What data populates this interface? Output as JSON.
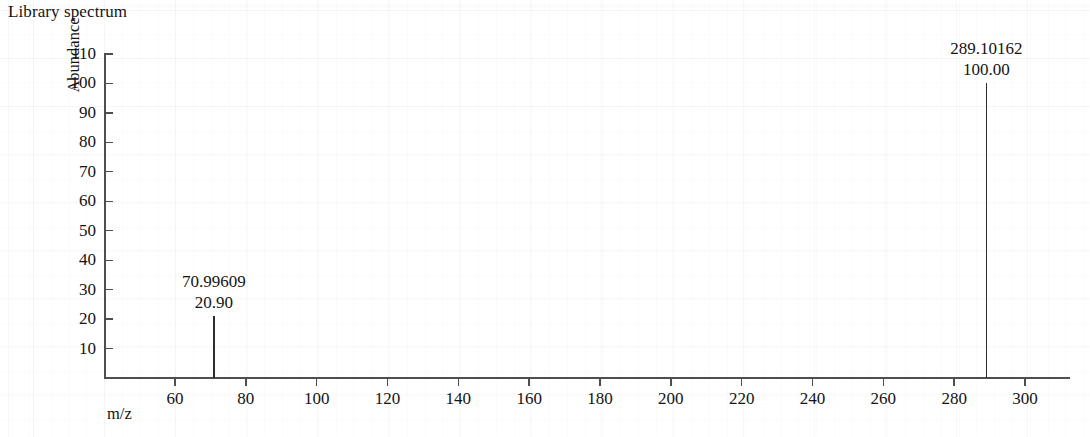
{
  "chart": {
    "title": "Library spectrum",
    "xlabel": "m/z",
    "ylabel": "Abundance"
  },
  "axes": {
    "y_ticks": [
      "110",
      "100",
      "90",
      "80",
      "70",
      "60",
      "50",
      "40",
      "30",
      "20",
      "10"
    ],
    "x_ticks": [
      "60",
      "80",
      "100",
      "120",
      "140",
      "160",
      "180",
      "200",
      "220",
      "240",
      "260",
      "280",
      "300"
    ]
  },
  "peaks": [
    {
      "mz": "70.99609",
      "abundance": "20.90"
    },
    {
      "mz": "289.10162",
      "abundance": "100.00"
    }
  ],
  "chart_data": {
    "type": "bar",
    "title": "Library spectrum",
    "subtitle": "",
    "xlabel": "m/z",
    "ylabel": "Abundance",
    "xlim": [
      45,
      313
    ],
    "ylim": [
      0,
      110
    ],
    "yticks": [
      10,
      20,
      30,
      40,
      50,
      60,
      70,
      80,
      90,
      100,
      110
    ],
    "xticks": [
      60,
      80,
      100,
      120,
      140,
      160,
      180,
      200,
      220,
      240,
      260,
      280,
      300
    ],
    "grid": false,
    "legend": null,
    "x": [
      70.99609,
      289.10162
    ],
    "values": [
      20.9,
      100.0
    ],
    "annotations": [
      {
        "x": 70.99609,
        "y": 20.9,
        "text": "70.99609\n20.90"
      },
      {
        "x": 289.10162,
        "y": 100.0,
        "text": "289.10162\n100.00"
      }
    ],
    "series": [
      {
        "name": "Library spectrum",
        "points": [
          {
            "mz": 70.99609,
            "abundance": 20.9
          },
          {
            "mz": 289.10162,
            "abundance": 100.0
          }
        ]
      }
    ]
  }
}
